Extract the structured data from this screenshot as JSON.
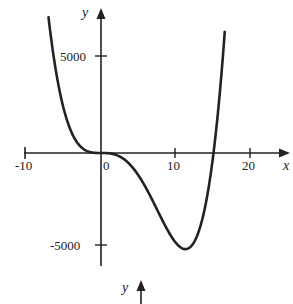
{
  "chart_data": {
    "type": "line",
    "title": "",
    "xlabel": "x",
    "ylabel": "y",
    "x_ticks": [
      "-10",
      "0",
      "10",
      "20"
    ],
    "y_ticks": [
      "5000",
      "-5000"
    ],
    "xlim": [
      -10,
      22
    ],
    "ylim": [
      -6200,
      7500
    ],
    "grid": false,
    "series": [
      {
        "name": "f(x)",
        "description": "quartic with flat root at x=0, root near x=15, minimum about -5000 near x=11",
        "x": [
          -7,
          -6,
          -5,
          -4,
          -3,
          -2,
          -1,
          0,
          2,
          4,
          6,
          8,
          10,
          11,
          12,
          13,
          14,
          15,
          16,
          16.5
        ],
        "y": [
          7093,
          4263,
          2350,
          1143,
          457,
          128,
          15,
          0,
          -98,
          -661,
          -1827,
          -3369,
          -4700,
          -5004,
          -4872,
          -4130,
          -2579,
          0,
          3850,
          6355
        ]
      }
    ],
    "second_axis_label": "y"
  },
  "labels": {
    "y_axis": "y",
    "x_axis": "x",
    "tick_5000": "5000",
    "tick_m5000": "-5000",
    "tick_m10": "-10",
    "tick_0": "0",
    "tick_10": "10",
    "tick_20": "20",
    "second_y": "y"
  }
}
